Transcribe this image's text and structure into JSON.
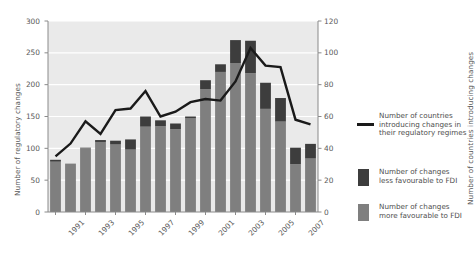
{
  "chart_data": {
    "type": "bar",
    "title": "",
    "subtitle": "",
    "xlabel": "",
    "ylabel": "Number of regulatory changes",
    "ylabel_right": "Number of countries introducing changes",
    "ylim": [
      0,
      300
    ],
    "ylim_right": [
      0,
      120
    ],
    "yticks": [
      0,
      50,
      100,
      150,
      200,
      250,
      300
    ],
    "yticks_right": [
      0,
      20,
      40,
      60,
      80,
      100,
      120
    ],
    "grid": true,
    "legend_position": "right",
    "categories": [
      "1991",
      "1992",
      "1993",
      "1994",
      "1995",
      "1996",
      "1997",
      "1998",
      "1999",
      "2000",
      "2001",
      "2002",
      "2003",
      "2004",
      "2005",
      "2006",
      "2007",
      "2008"
    ],
    "xtick_labels": [
      "1991",
      "1993",
      "1995",
      "1997",
      "1999",
      "2001",
      "2003",
      "2005",
      "2007"
    ],
    "stacked": true,
    "series": [
      {
        "name": "Number of changes more favourable to FDI",
        "type": "bar",
        "color": "#7f7f7f",
        "values": [
          79,
          76,
          100,
          110,
          106,
          98,
          134,
          135,
          130,
          147,
          193,
          220,
          234,
          218,
          162,
          142,
          75,
          84
        ]
      },
      {
        "name": "Number of changes less favourable to FDI",
        "type": "bar",
        "color": "#3d3d3d",
        "values": [
          3,
          0,
          1,
          3,
          6,
          16,
          16,
          9,
          9,
          3,
          14,
          12,
          36,
          51,
          41,
          37,
          26,
          23
        ]
      },
      {
        "name": "Number of countries introducing changes in their regulatory regimes",
        "type": "line",
        "color": "#1a1a1a",
        "axis": "right",
        "values": [
          35,
          43,
          57,
          49,
          64,
          65,
          76,
          60,
          63,
          69,
          71,
          70,
          82,
          103,
          92,
          91,
          58,
          55
        ]
      }
    ],
    "legend": [
      {
        "marker": "line",
        "color": "#1a1a1a",
        "label": "Number of countries\nintroducing changes in\ntheir regulatory regimes"
      },
      {
        "marker": "swatch",
        "color": "#3d3d3d",
        "label": "Number of changes\nless favourable to FDI"
      },
      {
        "marker": "swatch",
        "color": "#7f7f7f",
        "label": "Number of changes\nmore favourable to FDI"
      }
    ],
    "plot_background": "#eaeaea",
    "grid_color": "#ffffff"
  }
}
